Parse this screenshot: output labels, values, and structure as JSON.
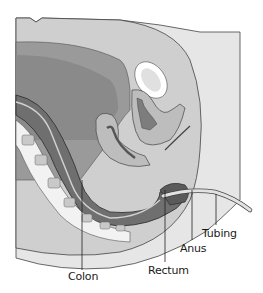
{
  "figure": {
    "type": "anatomical cross-section",
    "view": "sagittal",
    "colors": {
      "background": "#ffffff",
      "skin": "#e6e6e6",
      "outer_tissue": "#cfcfcf",
      "abdominal_cavity": "#9a9a9a",
      "inner_cavity": "#8a8a8a",
      "colon_wall": "#6f6f6f",
      "colon_dark": "#5a5a5a",
      "organ_light": "#bdbdbd",
      "uterus": "#8f8f8f",
      "bladder_white": "#ffffff",
      "bone": "#f2f2f2",
      "bone_marrow": "#c9c9c9",
      "outline": "#333333",
      "tubing": "#d9d9d9"
    }
  },
  "labels": {
    "colon": "Colon",
    "rectum": "Rectum",
    "anus": "Anus",
    "tubing": "Tubing"
  }
}
